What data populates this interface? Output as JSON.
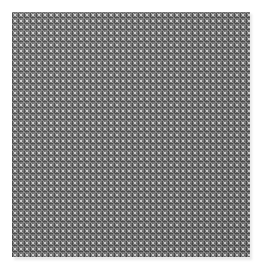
{
  "image": {
    "subject": "woven wire mesh / knit texture",
    "background_color": "#ffffff",
    "texture": {
      "base_color": "#6f6f6f",
      "highlight_color": "#dcdcdc",
      "shadow_color": "#282828",
      "cell_size_px": 6,
      "cells_across": 40,
      "cells_down": 41
    }
  }
}
